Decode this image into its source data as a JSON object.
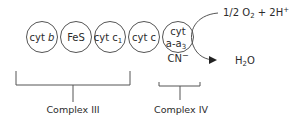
{
  "diagram": {
    "carriers": [
      {
        "id": "cyt-b",
        "label_main": "cyt",
        "label_italic": "b"
      },
      {
        "id": "fes",
        "label_main": "FeS"
      },
      {
        "id": "cyt-c1",
        "label_main": "cyt c",
        "label_sub": "1"
      },
      {
        "id": "cyt-c",
        "label_main": "cyt c"
      },
      {
        "id": "cyt-a-a3",
        "label_line1": "cyt",
        "label_line2": "a-a",
        "label_sub": "3"
      }
    ],
    "inhibitor": {
      "label": "CN",
      "charge": "−"
    },
    "reactant": {
      "prefix": "1/2 O",
      "sub": "2",
      "suffix": " + 2H",
      "sup": "+"
    },
    "product": {
      "prefix": "H",
      "sub": "2",
      "suffix": "O"
    },
    "complexes": [
      {
        "label": "Complex III"
      },
      {
        "label": "Complex IV"
      }
    ]
  }
}
